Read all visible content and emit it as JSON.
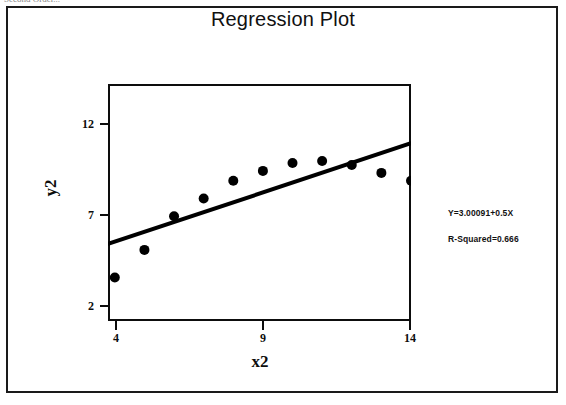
{
  "page": {
    "clipped_header_text": "Second Order...",
    "background_color": "#ffffff",
    "border_color": "#1a1a1a"
  },
  "chart": {
    "title": "Regression Plot",
    "xlabel": "x2",
    "ylabel": "y2",
    "equation_label": "Y=3.00091+0.5X",
    "rsquared_label": "R-Squared=0.666",
    "marker_color": "#000000",
    "line_color": "#000000"
  },
  "chart_data": {
    "type": "scatter",
    "title": "Regression Plot",
    "xlabel": "x2",
    "ylabel": "y2",
    "xlim": [
      3.77,
      14.0
    ],
    "ylim": [
      1.0,
      13.0
    ],
    "xticks": [
      4,
      9,
      14
    ],
    "yticks": [
      2,
      7,
      12
    ],
    "grid": false,
    "legend": false,
    "series": [
      {
        "name": "observed",
        "type": "scatter",
        "x": [
          4.0,
          5.0,
          6.0,
          7.0,
          8.0,
          9.0,
          10.0,
          11.0,
          12.0,
          13.0,
          14.0
        ],
        "y": [
          3.2,
          4.6,
          6.3,
          7.2,
          8.1,
          8.6,
          9.0,
          9.1,
          8.9,
          8.5,
          8.1
        ]
      },
      {
        "name": "fitted-line",
        "type": "line",
        "x": [
          3.77,
          14.0
        ],
        "y": [
          4.9,
          10.0
        ],
        "equation": "Y=3.00091+0.5X",
        "r_squared": 0.666
      }
    ],
    "annotations": [
      "Y=3.00091+0.5X",
      "R-Squared=0.666"
    ]
  }
}
